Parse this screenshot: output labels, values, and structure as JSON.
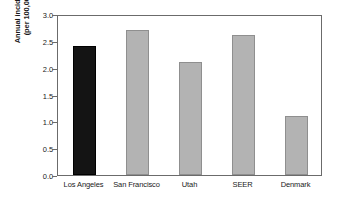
{
  "chart_data": {
    "type": "bar",
    "title": "",
    "subtitle": "",
    "xlabel": "",
    "ylabel_line1": "Annual incidence",
    "ylabel_line2": "(per 100,000)",
    "ylabel": "Annual incidence (per 100,000)",
    "categories": [
      "Los Angeles",
      "San Francisco",
      "Utah",
      "SEER",
      "Denmark"
    ],
    "values": [
      2.4,
      2.7,
      2.1,
      2.6,
      1.1
    ],
    "bar_colors": [
      "#141414",
      "#b3b3b3",
      "#b3b3b3",
      "#b3b3b3",
      "#b3b3b3"
    ],
    "highlight_category": "Los Angeles",
    "ylim": [
      0.0,
      3.0
    ],
    "ytick_values": [
      0.0,
      0.5,
      1.0,
      1.5,
      2.0,
      2.5,
      3.0
    ],
    "ytick_labels": [
      "0.0",
      "0.5",
      "1.0",
      "1.5",
      "2.0",
      "2.5",
      "3.0"
    ],
    "grid": false,
    "legend": false,
    "legend_position": "none",
    "frame": true,
    "annotations": []
  },
  "colors": {
    "background": "#ffffff",
    "axis": "#6b6b6b",
    "text": "#1a1a1a",
    "bar_gray": "#b3b3b3",
    "bar_gray_border": "#8f8f8f",
    "bar_black": "#141414"
  }
}
